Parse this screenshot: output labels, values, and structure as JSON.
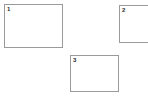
{
  "canvas": {
    "width": 148,
    "height": 99,
    "background_color": "#ffffff"
  },
  "style": {
    "panel_border_color": "#9a9a9a",
    "panel_fill_color": "#ffffff",
    "label_color": "#2b2b2b"
  },
  "panels": [
    {
      "id": "panel-1",
      "label": "1",
      "clipped": false
    },
    {
      "id": "panel-2",
      "label": "2",
      "clipped": true
    },
    {
      "id": "panel-3",
      "label": "3",
      "clipped": false
    }
  ]
}
